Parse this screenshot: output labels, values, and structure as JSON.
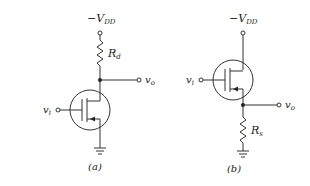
{
  "diagrams": [
    {
      "id": "a",
      "caption": "(a)",
      "supply_label": "−V",
      "supply_sub": "DD",
      "resistor_label": "R",
      "resistor_sub": "d",
      "input_label": "v",
      "input_sub": "i",
      "output_label": "v",
      "output_sub": "o"
    },
    {
      "id": "b",
      "caption": "(b)",
      "supply_label": "−V",
      "supply_sub": "DD",
      "resistor_label": "R",
      "resistor_sub": "s",
      "input_label": "v",
      "input_sub": "i",
      "output_label": "v",
      "output_sub": "o"
    }
  ]
}
